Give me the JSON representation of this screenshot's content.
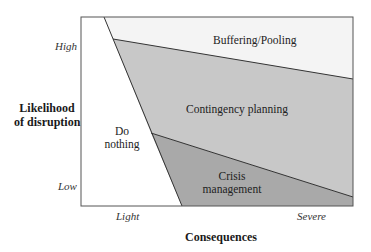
{
  "diagram": {
    "type": "region-matrix",
    "colors": {
      "buffering": "#f4f4f4",
      "contingency": "#c8c8c8",
      "crisis": "#a9a9a9",
      "do_nothing": "#ffffff",
      "stroke": "#333333"
    },
    "y_axis": {
      "title_line1": "Likelihood",
      "title_line2": "of disruption",
      "tick_high": "High",
      "tick_low": "Low"
    },
    "x_axis": {
      "title": "Consequences",
      "tick_light": "Light",
      "tick_severe": "Severe"
    },
    "regions": {
      "buffering": "Buffering/Pooling",
      "contingency": "Contingency planning",
      "do_nothing_line1": "Do",
      "do_nothing_line2": "nothing",
      "crisis_line1": "Crisis",
      "crisis_line2": "management"
    }
  }
}
